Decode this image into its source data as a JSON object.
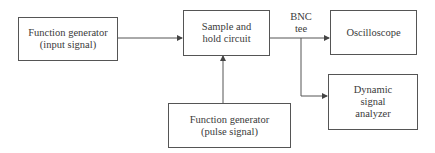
{
  "diagram": {
    "nodes": [
      {
        "id": "fg_input",
        "lines": [
          "Function generator",
          "(input signal)"
        ]
      },
      {
        "id": "sample_hold",
        "lines": [
          "Sample and",
          "hold circuit"
        ]
      },
      {
        "id": "oscilloscope",
        "lines": [
          "Oscilloscope"
        ]
      },
      {
        "id": "dsa",
        "lines": [
          "Dynamic",
          "signal",
          "analyzer"
        ]
      },
      {
        "id": "fg_pulse",
        "lines": [
          "Function generator",
          "(pulse signal)"
        ]
      }
    ],
    "junction_label": [
      "BNC",
      "tee"
    ],
    "edges": [
      {
        "from": "fg_input",
        "to": "sample_hold"
      },
      {
        "from": "fg_pulse",
        "to": "sample_hold"
      },
      {
        "from": "sample_hold",
        "to": "oscilloscope",
        "via": "BNC tee"
      },
      {
        "from": "sample_hold",
        "to": "dsa",
        "via": "BNC tee"
      }
    ],
    "colors": {
      "line": "#555555",
      "text": "#3a3a3a",
      "background": "#ffffff"
    }
  }
}
